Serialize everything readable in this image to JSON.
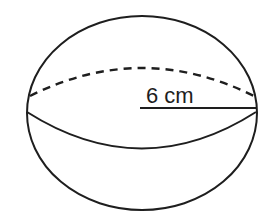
{
  "diagram": {
    "shape": "sphere",
    "radius_label": "6 cm",
    "colors": {
      "stroke": "#1e1e1e",
      "background": "#ffffff"
    }
  }
}
